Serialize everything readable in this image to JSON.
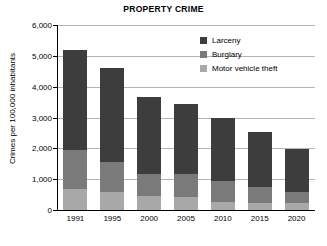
{
  "chart_data": {
    "type": "bar",
    "subtype": "stacked-bar",
    "title": "PROPERTY CRIME",
    "xlabel": "",
    "ylabel": "Crimes per 100,000 inhabitants",
    "categories": [
      "1991",
      "1995",
      "2000",
      "2005",
      "2010",
      "2015",
      "2020"
    ],
    "ylim": [
      0,
      6000
    ],
    "yticks": [
      "0",
      "1,000",
      "2,000",
      "3,000",
      "4,000",
      "5,000",
      "6,000"
    ],
    "ytick_values": [
      0,
      1000,
      2000,
      3000,
      4000,
      5000,
      6000
    ],
    "grid": true,
    "legend_position": "top-right",
    "series": [
      {
        "name": "Larceny",
        "color": "#3d3d3d",
        "values": [
          3250,
          3060,
          2480,
          2270,
          2040,
          1780,
          1400
        ]
      },
      {
        "name": "Burglary",
        "color": "#7a7a7a",
        "values": [
          1270,
          980,
          730,
          750,
          680,
          520,
          350
        ]
      },
      {
        "name": "Motor vehicle theft",
        "color": "#a8a8a8",
        "values": [
          680,
          580,
          440,
          420,
          260,
          230,
          230
        ]
      }
    ],
    "totals": [
      5200,
      4620,
      3650,
      3440,
      2980,
      2530,
      1980
    ]
  },
  "legend": {
    "items": [
      {
        "label": "Larceny"
      },
      {
        "label": "Burglary"
      },
      {
        "label": "Motor vehicle theft"
      }
    ]
  }
}
